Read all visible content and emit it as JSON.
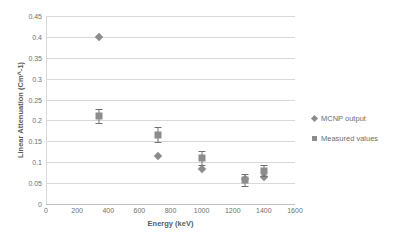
{
  "chart_data": {
    "type": "scatter",
    "title": "",
    "xlabel": "Energy (keV)",
    "ylabel": "Linear Attenuation (Cm^-1)",
    "xlim": [
      0,
      1600
    ],
    "ylim": [
      0,
      0.45
    ],
    "xticks": [
      0,
      200,
      400,
      600,
      800,
      1000,
      1200,
      1400,
      1600
    ],
    "xtick_labels": [
      "0",
      "200",
      "400",
      "600",
      "800",
      "1000",
      "1200",
      "1400",
      "1600"
    ],
    "yticks": [
      0,
      0.05,
      0.1,
      0.15,
      0.2,
      0.25,
      0.3,
      0.35,
      0.4,
      0.45
    ],
    "ytick_labels": [
      "0",
      "0.05",
      "0.1",
      "0.15",
      "0.2",
      "0.25",
      "0.3",
      "0.35",
      "0.4",
      "0.45"
    ],
    "grid": "horizontal",
    "legend_position": "right",
    "marker_color": "#8c8c8c",
    "gridline_color": "#d9d9d9",
    "series": [
      {
        "name": "MCNP output",
        "marker": "diamond",
        "points": [
          {
            "x": 340,
            "y": 0.399
          },
          {
            "x": 720,
            "y": 0.115
          },
          {
            "x": 1000,
            "y": 0.083
          },
          {
            "x": 1280,
            "y": 0.06
          },
          {
            "x": 1400,
            "y": 0.065
          }
        ]
      },
      {
        "name": "Measured values",
        "marker": "square",
        "points": [
          {
            "x": 340,
            "y": 0.21,
            "err": 0.017
          },
          {
            "x": 720,
            "y": 0.166,
            "err": 0.018
          },
          {
            "x": 1000,
            "y": 0.11,
            "err": 0.017
          },
          {
            "x": 1280,
            "y": 0.058,
            "err": 0.015
          },
          {
            "x": 1400,
            "y": 0.08,
            "err": 0.013
          }
        ]
      }
    ]
  },
  "legend": {
    "items": [
      {
        "label": "MCNP output",
        "marker": "diamond"
      },
      {
        "label": "Measured values",
        "marker": "square"
      }
    ]
  }
}
